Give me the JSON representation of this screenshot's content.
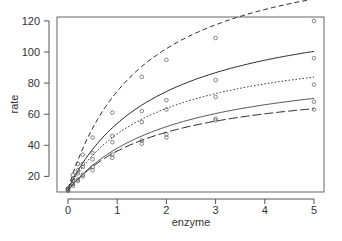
{
  "chart_data": {
    "type": "line",
    "title": "",
    "xlabel": "enzyme",
    "ylabel": "rate",
    "xlim": [
      -0.15,
      5.15
    ],
    "ylim": [
      9,
      122
    ],
    "xticks": [
      0,
      1,
      2,
      3,
      4,
      5
    ],
    "yticks": [
      20,
      40,
      60,
      80,
      100,
      120
    ],
    "grid": false,
    "legend": null,
    "x": [
      0,
      0.1,
      0.2,
      0.3,
      0.5,
      0.9,
      1.5,
      2,
      3,
      5
    ],
    "series": [
      {
        "name": "curve-1",
        "linestyle": "dashed",
        "vmax": 160,
        "km": 1.55,
        "base": 12,
        "points": [
          12,
          21,
          28,
          34,
          45,
          61,
          84,
          95,
          109,
          120
        ]
      },
      {
        "name": "curve-2",
        "linestyle": "solid",
        "vmax": 122,
        "km": 1.9,
        "base": 12,
        "points": [
          12,
          18,
          24,
          28,
          35,
          46,
          62,
          69,
          82,
          96
        ]
      },
      {
        "name": "curve-3",
        "linestyle": "dotted",
        "vmax": 97,
        "km": 1.75,
        "base": 12,
        "points": [
          12,
          17,
          22,
          26,
          31,
          42,
          55,
          63,
          71,
          79
        ]
      },
      {
        "name": "curve-4",
        "linestyle": "solid-thin",
        "vmax": 84,
        "km": 2.1,
        "base": 11,
        "points": [
          11,
          15,
          18,
          21,
          26,
          34,
          43,
          47,
          56,
          68
        ]
      },
      {
        "name": "curve-5",
        "linestyle": "longdash",
        "vmax": 72,
        "km": 1.85,
        "base": 11,
        "points": [
          11,
          14,
          17,
          20,
          24,
          32,
          41,
          45,
          57,
          63
        ]
      }
    ]
  },
  "axes": {
    "x_label": "enzyme",
    "y_label": "rate",
    "x_tick_labels": [
      "0",
      "1",
      "2",
      "3",
      "4",
      "5"
    ],
    "y_tick_labels": [
      "20",
      "40",
      "60",
      "80",
      "100",
      "120"
    ]
  },
  "colors": {
    "line": "#2a2a2a",
    "axis": "#555555",
    "text": "#333333"
  }
}
